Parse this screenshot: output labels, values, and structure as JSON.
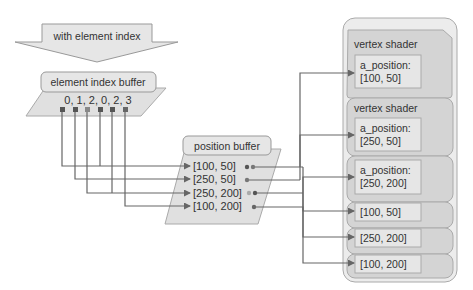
{
  "diagram": {
    "header_arrow": {
      "label": "with element index"
    },
    "element_index_buffer": {
      "title": "element index buffer",
      "values_text": "0, 1, 2, 0, 2, 3",
      "indices": [
        0,
        1,
        2,
        0,
        2,
        3
      ]
    },
    "position_buffer": {
      "title": "position buffer",
      "entries": [
        "[100, 50]",
        "[250, 50]",
        "[250, 200]",
        "[100, 200]"
      ]
    },
    "vertex_shaders": [
      {
        "title": "vertex shader",
        "attr_label": "a_position:",
        "value": "[100, 50]"
      },
      {
        "title": "vertex shader",
        "attr_label": "a_position:",
        "value": "[250, 50]"
      },
      {
        "title": "",
        "attr_label": "a_position:",
        "value": "[250, 200]"
      },
      {
        "title": "",
        "attr_label": "",
        "value": "[100, 50]"
      },
      {
        "title": "",
        "attr_label": "",
        "value": "[250, 200]"
      },
      {
        "title": "",
        "attr_label": "",
        "value": "[100, 200]"
      }
    ],
    "colors": {
      "line": "#666666",
      "box_fill": "#e2e2e2",
      "shader_fill": "#d4d4d4",
      "outer_fill": "#ececec",
      "text": "#333333"
    }
  }
}
